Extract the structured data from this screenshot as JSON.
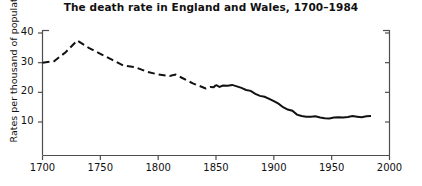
{
  "chart_data": {
    "type": "line",
    "title": "The death rate in England and Wales, 1700–1984",
    "xlabel": "",
    "ylabel": "Rates per thousand of population",
    "xlim": [
      1700,
      2000
    ],
    "ylim": [
      0,
      42
    ],
    "grid": false,
    "legend": null,
    "x_ticks": [
      1700,
      1750,
      1800,
      1850,
      1900,
      1950,
      2000
    ],
    "x_tick_labels": [
      "1700",
      "1750",
      "1800",
      "1850",
      "1900",
      "1950",
      "2000"
    ],
    "y_ticks": [
      10,
      20,
      30,
      40
    ],
    "y_tick_labels": [
      "10",
      "20",
      "30",
      "40"
    ],
    "line_color": "#111111",
    "series": [
      {
        "name": "Death rate (estimated)",
        "style": "dashed",
        "x": [
          1700,
          1710,
          1720,
          1730,
          1740,
          1750,
          1760,
          1770,
          1780,
          1790,
          1800,
          1810,
          1815,
          1820,
          1825,
          1830,
          1838,
          1841,
          1845,
          1848,
          1850
        ],
        "values": [
          30.0,
          30.5,
          33.5,
          37.5,
          35.0,
          33.0,
          31.0,
          29.0,
          28.5,
          27.0,
          26.0,
          25.5,
          26.0,
          25.0,
          24.0,
          23.0,
          21.8,
          21.3,
          21.8,
          21.7,
          22.5
        ]
      },
      {
        "name": "Death rate (registered)",
        "style": "solid",
        "x": [
          1850,
          1853,
          1856,
          1860,
          1864,
          1868,
          1872,
          1876,
          1880,
          1884,
          1888,
          1892,
          1896,
          1900,
          1904,
          1908,
          1912,
          1916,
          1920,
          1924,
          1928,
          1932,
          1936,
          1940,
          1944,
          1948,
          1952,
          1956,
          1960,
          1964,
          1968,
          1972,
          1976,
          1980,
          1984
        ],
        "values": [
          22.5,
          21.8,
          22.3,
          22.2,
          22.5,
          22.0,
          21.5,
          20.8,
          20.5,
          19.5,
          18.8,
          18.5,
          17.8,
          17.0,
          16.2,
          15.0,
          14.2,
          13.8,
          12.5,
          12.0,
          11.8,
          11.8,
          11.9,
          11.5,
          11.3,
          11.2,
          11.5,
          11.6,
          11.5,
          11.7,
          12.0,
          11.8,
          11.6,
          11.9,
          12.0
        ]
      }
    ]
  },
  "axes": {
    "left_axis_name": "left-value-axis",
    "right_axis_name": "right-value-axis",
    "bottom_axis_name": "bottom-year-axis"
  }
}
